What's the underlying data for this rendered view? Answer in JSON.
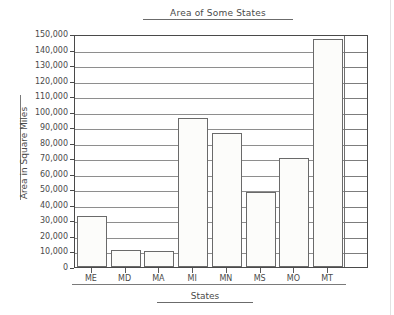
{
  "chart_data": {
    "type": "bar",
    "title": "Area of Some States",
    "xlabel": "States",
    "ylabel": "Area in Square Miles",
    "categories": [
      "ME",
      "MD",
      "MA",
      "MI",
      "MN",
      "MS",
      "MO",
      "MT"
    ],
    "values": [
      33000,
      11000,
      10000,
      96000,
      86000,
      48000,
      70000,
      147000
    ],
    "ylim": [
      0,
      150000
    ],
    "ytick_step": 10000,
    "ytick_labels": [
      "150,000",
      "140,000",
      "130,000",
      "120,000",
      "110,000",
      "100,000",
      "90,000",
      "80,000",
      "70,000",
      "60,000",
      "50,000",
      "40,000",
      "30,000",
      "20,000",
      "10,000",
      "0"
    ],
    "grid": true,
    "legend": "none",
    "colors": {
      "bar_fill": "#fcfcfa",
      "bar_stroke": "#6a6a6a",
      "grid": "#8e8e8e",
      "axis": "#4a4a4a",
      "text": "#4a4a4a",
      "background": "#ffffff"
    }
  }
}
